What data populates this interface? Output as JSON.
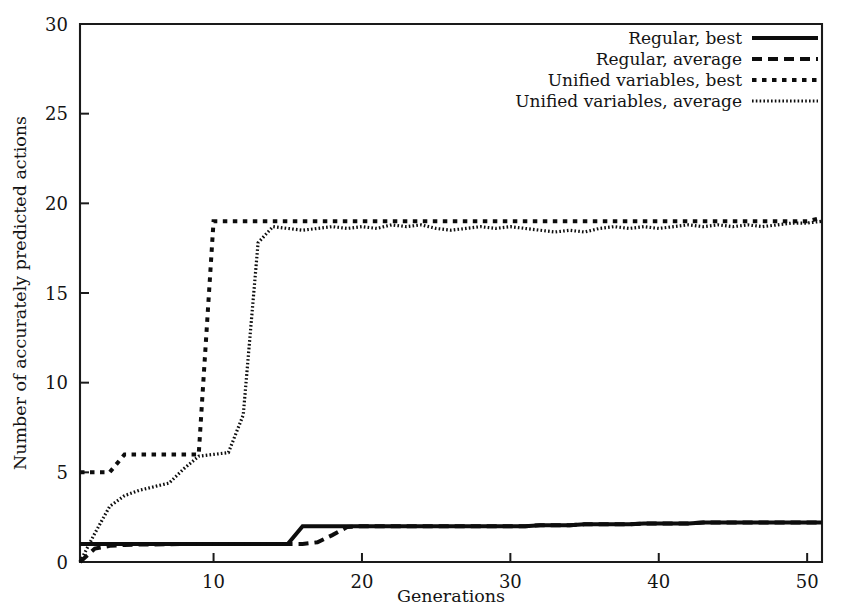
{
  "chart_data": {
    "type": "line",
    "title": "",
    "xlabel": "Generations",
    "ylabel": "Number of accurately predicted actions",
    "xlim": [
      1,
      51
    ],
    "ylim": [
      0,
      30
    ],
    "xticks": [
      10,
      20,
      30,
      40,
      50
    ],
    "xtick_labels": [
      "10",
      "20",
      "30",
      "40",
      "50"
    ],
    "yticks": [
      0,
      5,
      10,
      15,
      20,
      25,
      30
    ],
    "ytick_labels": [
      "0",
      "5",
      "10",
      "15",
      "20",
      "25",
      "30"
    ],
    "grid": false,
    "legend_position": "top-right",
    "x": [
      1,
      2,
      3,
      4,
      5,
      6,
      7,
      8,
      9,
      10,
      11,
      12,
      13,
      14,
      15,
      16,
      17,
      18,
      19,
      20,
      21,
      22,
      23,
      24,
      25,
      26,
      27,
      28,
      29,
      30,
      31,
      32,
      33,
      34,
      35,
      36,
      37,
      38,
      39,
      40,
      41,
      42,
      43,
      44,
      45,
      46,
      47,
      48,
      49,
      50,
      51
    ],
    "series": [
      {
        "name": "Regular, best",
        "style": "solid",
        "values": [
          1,
          1,
          1,
          1,
          1,
          1,
          1,
          1,
          1,
          1,
          1,
          1,
          1,
          1,
          1,
          2,
          2,
          2,
          2,
          2,
          2,
          2,
          2,
          2,
          2,
          2,
          2,
          2,
          2,
          2,
          2,
          2.05,
          2.05,
          2.05,
          2.1,
          2.1,
          2.1,
          2.1,
          2.15,
          2.15,
          2.15,
          2.15,
          2.2,
          2.2,
          2.2,
          2.2,
          2.2,
          2.2,
          2.2,
          2.2,
          2.2
        ]
      },
      {
        "name": "Regular, average",
        "style": "dashed",
        "values": [
          0,
          0.75,
          0.9,
          0.95,
          0.97,
          0.98,
          0.99,
          1,
          1,
          1,
          1,
          1,
          1,
          1,
          1,
          1,
          1.1,
          1.5,
          1.95,
          2,
          2,
          2,
          2,
          2,
          2,
          2,
          2,
          2,
          2,
          2,
          2,
          2.05,
          2.05,
          2.05,
          2.1,
          2.1,
          2.1,
          2.1,
          2.15,
          2.15,
          2.15,
          2.15,
          2.2,
          2.2,
          2.2,
          2.2,
          2.2,
          2.2,
          2.2,
          2.2,
          2.2
        ]
      },
      {
        "name": "Unified variables, best",
        "style": "dotted-coarse",
        "values": [
          5,
          5,
          5,
          6,
          6,
          6,
          6,
          6,
          6,
          19,
          19,
          19,
          19,
          19,
          19,
          19,
          19,
          19,
          19,
          19,
          19,
          19,
          19,
          19,
          19,
          19,
          19,
          19,
          19,
          19,
          19,
          19,
          19,
          19,
          19,
          19,
          19,
          19,
          19,
          19,
          19,
          19,
          19,
          19,
          19,
          19,
          19,
          19,
          19,
          19,
          19.2
        ]
      },
      {
        "name": "Unified variables, average",
        "style": "dotted-fine",
        "values": [
          0,
          1.6,
          3.1,
          3.7,
          4.0,
          4.2,
          4.4,
          5.2,
          5.9,
          6.0,
          6.1,
          8.2,
          17.8,
          18.7,
          18.6,
          18.5,
          18.6,
          18.7,
          18.6,
          18.7,
          18.6,
          18.8,
          18.7,
          18.8,
          18.6,
          18.5,
          18.6,
          18.7,
          18.6,
          18.7,
          18.6,
          18.5,
          18.4,
          18.5,
          18.4,
          18.6,
          18.7,
          18.6,
          18.7,
          18.6,
          18.7,
          18.8,
          18.7,
          18.8,
          18.7,
          18.8,
          18.7,
          18.8,
          18.9,
          18.9,
          19.0
        ]
      }
    ],
    "legend": [
      "Regular, best",
      "Regular, average",
      "Unified variables, best",
      "Unified variables, average"
    ]
  }
}
